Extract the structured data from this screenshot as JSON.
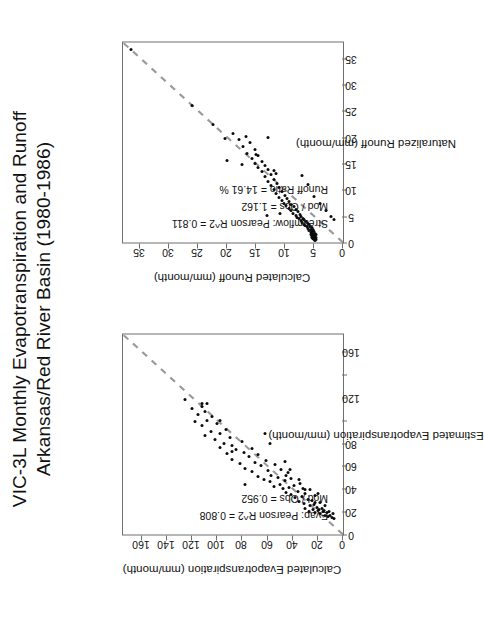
{
  "figure": {
    "title": "VIC-3L Monthly Evapotranspiration and Runoff\nArkansas/Red River Basin (1980-1986)",
    "background": "#ffffff",
    "point_color": "#0b0b0b",
    "line_color": "#9a9a9a",
    "frame_color": "#6f6f6f"
  },
  "chart_data": [
    {
      "id": "evapotranspiration",
      "type": "scatter",
      "title": "",
      "xlabel": "Estimated Evapotranspiration (mm/month)",
      "ylabel": "Calculated Evapotranspiration (mm/month)",
      "xlim": [
        0,
        175
      ],
      "ylim": [
        0,
        175
      ],
      "xticks": [
        0,
        20,
        40,
        60,
        80,
        100,
        120,
        140,
        160
      ],
      "xtick_labels": [
        "0",
        "20",
        "40",
        "60",
        "80",
        "",
        "120",
        "",
        "160"
      ],
      "yticks": [
        0,
        20,
        40,
        60,
        80,
        100,
        120,
        140,
        160
      ],
      "ytick_labels": [
        "0",
        "20",
        "40",
        "60",
        "80",
        "100",
        "120",
        "140",
        "160"
      ],
      "grid": false,
      "legend": null,
      "reference_line": {
        "type": "1:1 dashed",
        "from": [
          0,
          0
        ],
        "to": [
          175,
          175
        ]
      },
      "annotations": [
        "Evap: Pearson R^2 = 0.808",
        "Mod / Obs = 0.952"
      ],
      "x": [
        14,
        15,
        16,
        17,
        17,
        18,
        18,
        19,
        19,
        20,
        20,
        20,
        21,
        21,
        22,
        22,
        23,
        23,
        24,
        25,
        25,
        26,
        27,
        28,
        29,
        30,
        31,
        32,
        33,
        34,
        35,
        36,
        37,
        38,
        39,
        40,
        40,
        41,
        42,
        43,
        44,
        45,
        46,
        47,
        48,
        49,
        50,
        51,
        52,
        54,
        55,
        56,
        57,
        58,
        60,
        61,
        62,
        63,
        65,
        66,
        68,
        70,
        71,
        72,
        74,
        75,
        76,
        78,
        80,
        81,
        83,
        85,
        87,
        88,
        90,
        92,
        95,
        97,
        99,
        100,
        103,
        105,
        108,
        110,
        112,
        115,
        118,
        44,
        80,
        100,
        115,
        57,
        88,
        64,
        36,
        48,
        52,
        73,
        39,
        28
      ],
      "y": [
        7,
        9,
        12,
        10,
        14,
        8,
        18,
        13,
        22,
        11,
        16,
        27,
        15,
        20,
        19,
        24,
        17,
        30,
        21,
        14,
        26,
        23,
        31,
        18,
        35,
        25,
        28,
        38,
        33,
        22,
        41,
        30,
        45,
        36,
        26,
        48,
        32,
        43,
        55,
        39,
        50,
        34,
        58,
        46,
        63,
        41,
        52,
        68,
        57,
        44,
        72,
        60,
        49,
        78,
        65,
        54,
        82,
        70,
        61,
        88,
        75,
        68,
        92,
        79,
        85,
        72,
        98,
        88,
        95,
        80,
        102,
        90,
        110,
        98,
        105,
        93,
        112,
        100,
        118,
        108,
        104,
        115,
        110,
        120,
        112,
        108,
        126,
        78,
        58,
        98,
        112,
        42,
        62,
        46,
        20,
        35,
        45,
        88,
        30,
        22
      ]
    },
    {
      "id": "runoff",
      "type": "scatter",
      "title": "",
      "xlabel": "Naturalized Runoff (mm/month)",
      "ylabel": "Calculated Runoff (mm/month)",
      "xlim": [
        0,
        38
      ],
      "ylim": [
        0,
        38
      ],
      "xticks": [
        0,
        5,
        10,
        15,
        20,
        25,
        30,
        35
      ],
      "xtick_labels": [
        "0",
        "5",
        "10",
        "15",
        "20",
        "25",
        "30",
        "35"
      ],
      "yticks": [
        0,
        5,
        10,
        15,
        20,
        25,
        30,
        35
      ],
      "ytick_labels": [
        "0",
        "5",
        "10",
        "15",
        "20",
        "25",
        "30",
        "35"
      ],
      "grid": false,
      "legend": null,
      "reference_line": {
        "type": "1:1 dashed",
        "from": [
          0,
          0
        ],
        "to": [
          38,
          38
        ]
      },
      "annotations": [
        "Streamflow: Pearson R^2 = 0.811",
        "Mod / Obs = 1.162",
        "Runoff Ratio = 14.61 %"
      ],
      "x": [
        0.4,
        0.5,
        0.6,
        0.7,
        0.8,
        0.9,
        1.0,
        1.0,
        1.1,
        1.2,
        1.3,
        1.4,
        1.5,
        1.5,
        1.6,
        1.7,
        1.8,
        1.9,
        2.0,
        2.1,
        2.2,
        2.3,
        2.4,
        2.5,
        2.6,
        2.8,
        3.0,
        3.1,
        3.2,
        3.4,
        3.5,
        3.6,
        3.8,
        4.0,
        4.1,
        4.3,
        4.5,
        4.6,
        4.8,
        5.0,
        5.2,
        5.4,
        5.6,
        5.8,
        6.0,
        6.2,
        6.5,
        6.8,
        7.0,
        7.2,
        7.5,
        7.8,
        8.0,
        8.3,
        8.6,
        9.0,
        9.3,
        9.6,
        10.0,
        10.4,
        10.8,
        11.2,
        11.6,
        12.0,
        12.5,
        13.0,
        13.4,
        13.8,
        14.2,
        14.6,
        15.0,
        15.4,
        16.0,
        16.5,
        17.0,
        17.6,
        18.2,
        19.0,
        19.6,
        20.2,
        20.8,
        22.4,
        26.0,
        36.6,
        5.2,
        5.5,
        4.9,
        6.1,
        7.4,
        8.8,
        11.0,
        12.8,
        13.6,
        14.8,
        15.6,
        16.8,
        19.8,
        20.0,
        13.2,
        4.4
      ],
      "y": [
        4.8,
        5.0,
        4.6,
        5.2,
        5.1,
        4.9,
        5.3,
        4.7,
        5.0,
        5.4,
        4.8,
        5.2,
        5.5,
        4.6,
        5.1,
        5.3,
        4.9,
        5.6,
        5.0,
        5.4,
        5.2,
        5.8,
        5.1,
        5.5,
        6.0,
        5.3,
        6.2,
        5.7,
        6.5,
        5.9,
        6.8,
        6.1,
        7.0,
        6.4,
        7.3,
        6.7,
        7.6,
        6.9,
        7.9,
        7.2,
        8.2,
        7.5,
        8.6,
        7.8,
        9.0,
        8.1,
        9.4,
        8.5,
        9.8,
        8.9,
        10.2,
        9.3,
        10.6,
        9.7,
        11.0,
        10.1,
        11.5,
        10.5,
        12.0,
        11.0,
        12.5,
        11.4,
        13.0,
        11.9,
        13.5,
        12.4,
        14.0,
        12.9,
        14.6,
        13.4,
        15.2,
        14.0,
        15.8,
        14.6,
        16.5,
        15.2,
        17.2,
        16.0,
        18.0,
        16.8,
        19.0,
        22.4,
        26.0,
        36.6,
        13.2,
        10.8,
        2.0,
        3.0,
        4.0,
        5.0,
        6.0,
        7.0,
        12.0,
        17.5,
        20.0,
        15.0,
        20.4,
        13.0,
        11.6,
        1.6
      ]
    }
  ]
}
